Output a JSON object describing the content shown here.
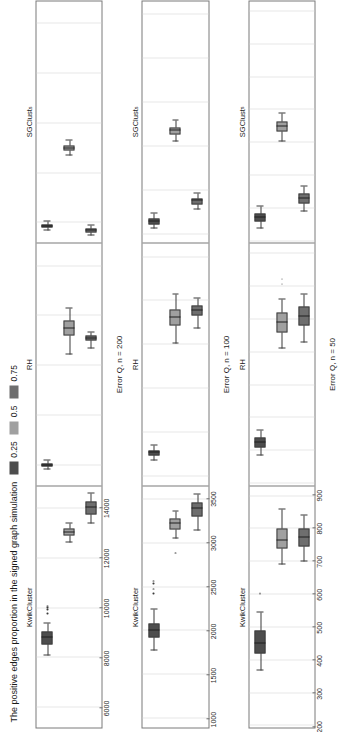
{
  "legend": {
    "title": "The positive edges proportion in the signed graph simulation",
    "items": [
      {
        "label": "0.25",
        "color": "#4d4d4d"
      },
      {
        "label": "0.5",
        "color": "#a0a0a0"
      },
      {
        "label": "0.75",
        "color": "#6e6e6e"
      }
    ]
  },
  "facet_labels": [
    {
      "text": "KwikCluster",
      "sub": ""
    },
    {
      "text": "RH",
      "sub": ""
    },
    {
      "text": "SGClust",
      "sub": "s"
    }
  ],
  "chart_data": {
    "type": "box",
    "title": "",
    "orientation": "horizontal-rotated",
    "grid": true,
    "legend_position": "top-left",
    "legend_title": "The positive edges proportion in the signed graph simulation",
    "groups": [
      "0.25",
      "0.5",
      "0.75"
    ],
    "group_colors": [
      "#4d4d4d",
      "#a0a0a0",
      "#6e6e6e"
    ],
    "facets": [
      "KwikCluster",
      "RH",
      "SGClusts"
    ],
    "panels": [
      {
        "name": "n200",
        "ylabel": "Error Q, n = 200",
        "ticks": [
          14000,
          12000,
          10000,
          8000,
          6000
        ],
        "ylim": [
          5200,
          14900
        ],
        "boxes": [
          {
            "facet": "KwikCluster",
            "group": "0.25",
            "min": 8100,
            "q1": 8550,
            "median": 8800,
            "q3": 9050,
            "max": 9400,
            "outliers": [
              9750,
              9900,
              10000,
              10050
            ]
          },
          {
            "facet": "KwikCluster",
            "group": "0.5",
            "min": 12650,
            "q1": 12900,
            "median": 13050,
            "q3": 13200,
            "max": 13400,
            "outliers": []
          },
          {
            "facet": "KwikCluster",
            "group": "0.75",
            "min": 13400,
            "q1": 13750,
            "median": 14050,
            "q3": 14300,
            "max": 14600,
            "outliers": []
          },
          {
            "facet": "RH",
            "group": "0.25",
            "min": 5850,
            "q1": 5950,
            "median": 6000,
            "q3": 6060,
            "max": 6180,
            "outliers": []
          },
          {
            "facet": "RH",
            "group": "0.5",
            "min": 10450,
            "q1": 11200,
            "median": 11500,
            "q3": 11800,
            "max": 12300,
            "outliers": []
          },
          {
            "facet": "RH",
            "group": "0.75",
            "min": 10700,
            "q1": 11000,
            "median": 11100,
            "q3": 11200,
            "max": 11350,
            "outliers": []
          },
          {
            "facet": "SGClusts",
            "group": "0.25",
            "min": 5700,
            "q1": 5800,
            "median": 5850,
            "q3": 5920,
            "max": 6050,
            "outliers": []
          },
          {
            "facet": "SGClusts",
            "group": "0.5",
            "min": 8700,
            "q1": 8900,
            "median": 9000,
            "q3": 9100,
            "max": 9300,
            "outliers": []
          },
          {
            "facet": "SGClusts",
            "group": "0.75",
            "min": 5500,
            "q1": 5620,
            "median": 5700,
            "q3": 5780,
            "max": 5900,
            "outliers": []
          }
        ]
      },
      {
        "name": "n100",
        "ylabel": "Error Q, n = 100",
        "ticks": [
          3500,
          3000,
          2500,
          2000,
          1500,
          1000
        ],
        "ylim": [
          900,
          3650
        ],
        "boxes": [
          {
            "facet": "KwikCluster",
            "group": "0.25",
            "min": 1780,
            "q1": 1930,
            "median": 2000,
            "q3": 2090,
            "max": 2250,
            "outliers": [
              2420,
              2470,
              2530,
              2560
            ]
          },
          {
            "facet": "KwikCluster",
            "group": "0.5",
            "min": 3050,
            "q1": 3160,
            "median": 3230,
            "q3": 3280,
            "max": 3360,
            "outliers": [
              2880
            ]
          },
          {
            "facet": "KwikCluster",
            "group": "0.75",
            "min": 3150,
            "q1": 3300,
            "median": 3390,
            "q3": 3460,
            "max": 3560,
            "outliers": []
          },
          {
            "facet": "RH",
            "group": "0.25",
            "min": 1180,
            "q1": 1240,
            "median": 1270,
            "q3": 1300,
            "max": 1350,
            "outliers": []
          },
          {
            "facet": "RH",
            "group": "0.5",
            "min": 2520,
            "q1": 2720,
            "median": 2810,
            "q3": 2900,
            "max": 3070,
            "outliers": []
          },
          {
            "facet": "RH",
            "group": "0.75",
            "min": 2690,
            "q1": 2830,
            "median": 2890,
            "q3": 2950,
            "max": 3030,
            "outliers": []
          },
          {
            "facet": "SGClusts",
            "group": "0.25",
            "min": 1060,
            "q1": 1110,
            "median": 1140,
            "q3": 1180,
            "max": 1230,
            "outliers": []
          },
          {
            "facet": "SGClusts",
            "group": "0.5",
            "min": 2060,
            "q1": 2140,
            "median": 2180,
            "q3": 2220,
            "max": 2290,
            "outliers": []
          },
          {
            "facet": "SGClusts",
            "group": "0.75",
            "min": 1280,
            "q1": 1340,
            "median": 1380,
            "q3": 1410,
            "max": 1460,
            "outliers": []
          }
        ]
      },
      {
        "name": "n50",
        "ylabel": "Error Q, n = 50",
        "ticks": [
          900,
          800,
          700,
          600,
          500,
          400,
          300,
          200
        ],
        "ylim": [
          195,
          930
        ],
        "boxes": [
          {
            "facet": "KwikCluster",
            "group": "0.25",
            "min": 370,
            "q1": 420,
            "median": 450,
            "q3": 490,
            "max": 545,
            "outliers": [
              600
            ]
          },
          {
            "facet": "KwikCluster",
            "group": "0.5",
            "min": 690,
            "q1": 740,
            "median": 765,
            "q3": 800,
            "max": 860,
            "outliers": []
          },
          {
            "facet": "KwikCluster",
            "group": "0.75",
            "min": 700,
            "q1": 745,
            "median": 775,
            "q3": 800,
            "max": 840,
            "outliers": []
          },
          {
            "facet": "RH",
            "group": "0.25",
            "min": 285,
            "q1": 310,
            "median": 325,
            "q3": 340,
            "max": 360,
            "outliers": []
          },
          {
            "facet": "RH",
            "group": "0.5",
            "min": 610,
            "q1": 660,
            "median": 690,
            "q3": 720,
            "max": 760,
            "outliers": [
              805,
              820
            ]
          },
          {
            "facet": "RH",
            "group": "0.75",
            "min": 630,
            "q1": 680,
            "median": 710,
            "q3": 740,
            "max": 775,
            "outliers": []
          },
          {
            "facet": "SGClusts",
            "group": "0.25",
            "min": 240,
            "q1": 260,
            "median": 272,
            "q3": 285,
            "max": 305,
            "outliers": []
          },
          {
            "facet": "SGClusts",
            "group": "0.5",
            "min": 505,
            "q1": 535,
            "median": 550,
            "q3": 565,
            "max": 590,
            "outliers": []
          },
          {
            "facet": "SGClusts",
            "group": "0.75",
            "min": 290,
            "q1": 315,
            "median": 330,
            "q3": 345,
            "max": 368,
            "outliers": []
          }
        ]
      }
    ]
  }
}
